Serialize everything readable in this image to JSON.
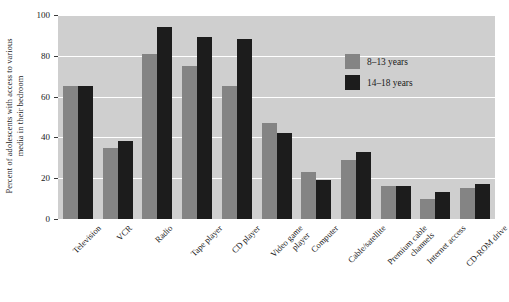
{
  "chart_data": {
    "type": "bar",
    "title": "",
    "xlabel": "",
    "ylabel": "Percent of adolescents with access to various media in their bedroom",
    "ylabel_lines": [
      "Percent of adolescents with access to various",
      "media in their bedroom"
    ],
    "ylim": [
      0,
      100
    ],
    "yticks": [
      0,
      20,
      40,
      60,
      80,
      100
    ],
    "ytick_labels": [
      "0",
      "20",
      "40",
      "60",
      "80",
      "100"
    ],
    "grid": "horizontal-white",
    "legend_position": "upper-right-inside",
    "categories": [
      "Television",
      "VCR",
      "Radio",
      "Tape player",
      "CD player",
      "Video game player",
      "Computer",
      "Cable/satellite",
      "Premium cable channels",
      "Internet access",
      "CD-ROM drive"
    ],
    "category_lines": [
      [
        "Television"
      ],
      [
        "VCR"
      ],
      [
        "Radio"
      ],
      [
        "Tape player"
      ],
      [
        "CD player"
      ],
      [
        "Video game",
        "player"
      ],
      [
        "Computer"
      ],
      [
        "Cable/satellite"
      ],
      [
        "Premium cable",
        "channels"
      ],
      [
        "Internet access"
      ],
      [
        "CD-ROM drive"
      ]
    ],
    "series": [
      {
        "name": "8–13 years",
        "color": "#848484",
        "values": [
          65,
          35,
          81,
          75,
          65,
          47,
          23,
          29,
          16,
          10,
          15
        ]
      },
      {
        "name": "14–18 years",
        "color": "#1c1c1c",
        "values": [
          65,
          38,
          94,
          89,
          88,
          42,
          19,
          33,
          16,
          13,
          17
        ]
      }
    ]
  },
  "legend": {
    "entries": [
      {
        "label": "8–13 years",
        "color": "#848484"
      },
      {
        "label": "14–18 years",
        "color": "#1c1c1c"
      }
    ]
  },
  "colors": {
    "plot_background": "#cfcfcf",
    "gridline": "#ffffff",
    "page_background": "#ffffff",
    "text": "#1a1a1a",
    "series_young": "#848484",
    "series_old": "#1c1c1c"
  }
}
